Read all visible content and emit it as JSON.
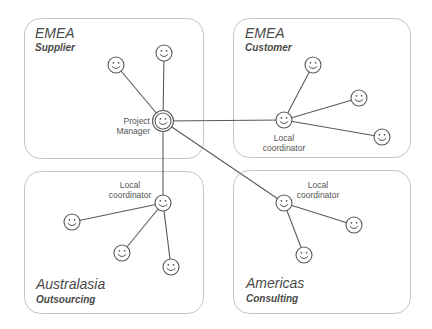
{
  "regions": [
    {
      "id": "emea-supplier",
      "title": "EMEA",
      "subtitle": "Supplier",
      "box": {
        "x": 24,
        "y": 18,
        "w": 179,
        "h": 140
      }
    },
    {
      "id": "emea-customer",
      "title": "EMEA",
      "subtitle": "Customer",
      "box": {
        "x": 233,
        "y": 18,
        "w": 177,
        "h": 139
      }
    },
    {
      "id": "australasia-outsourcing",
      "title": "Australasia",
      "subtitle": "Outsourcing",
      "box": {
        "x": 24,
        "y": 171,
        "w": 179,
        "h": 142
      }
    },
    {
      "id": "americas-consulting",
      "title": "Americas",
      "subtitle": "Consulting",
      "box": {
        "x": 233,
        "y": 170,
        "w": 177,
        "h": 143
      }
    }
  ],
  "roles": {
    "project_manager": {
      "line1": "Project",
      "line2": "Manager"
    },
    "local_coordinator": {
      "line1": "Local",
      "line2": "coordinator"
    }
  },
  "nodes": [
    {
      "id": "pm",
      "role": "Project Manager",
      "x": 163,
      "y": 121,
      "hub": true
    },
    {
      "id": "sup1",
      "x": 116,
      "y": 65
    },
    {
      "id": "sup2",
      "x": 164,
      "y": 53
    },
    {
      "id": "cus-lc",
      "role": "Local coordinator",
      "x": 284,
      "y": 120
    },
    {
      "id": "cus1",
      "x": 313,
      "y": 65
    },
    {
      "id": "cus2",
      "x": 359,
      "y": 98
    },
    {
      "id": "cus3",
      "x": 382,
      "y": 137
    },
    {
      "id": "aus-lc",
      "role": "Local coordinator",
      "x": 163,
      "y": 203
    },
    {
      "id": "aus1",
      "x": 72,
      "y": 222
    },
    {
      "id": "aus2",
      "x": 122,
      "y": 253
    },
    {
      "id": "aus3",
      "x": 171,
      "y": 267
    },
    {
      "id": "ame-lc",
      "role": "Local coordinator",
      "x": 284,
      "y": 203
    },
    {
      "id": "ame1",
      "x": 354,
      "y": 225
    },
    {
      "id": "ame2",
      "x": 304,
      "y": 255
    }
  ],
  "edges": [
    [
      "pm",
      "sup1"
    ],
    [
      "pm",
      "sup2"
    ],
    [
      "pm",
      "cus-lc"
    ],
    [
      "pm",
      "aus-lc"
    ],
    [
      "pm",
      "ame-lc"
    ],
    [
      "cus-lc",
      "cus1"
    ],
    [
      "cus-lc",
      "cus2"
    ],
    [
      "cus-lc",
      "cus3"
    ],
    [
      "aus-lc",
      "aus1"
    ],
    [
      "aus-lc",
      "aus2"
    ],
    [
      "aus-lc",
      "aus3"
    ],
    [
      "ame-lc",
      "ame1"
    ],
    [
      "ame-lc",
      "ame2"
    ]
  ]
}
